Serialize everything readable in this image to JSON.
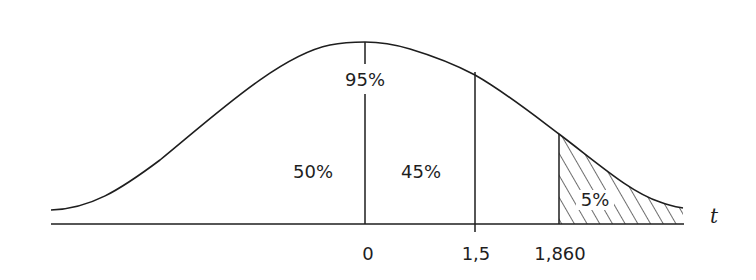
{
  "diagram": {
    "type": "t-distribution",
    "axis_variable": "t",
    "area_labels": {
      "left_half": "50%",
      "center_to_critical": "45%",
      "total_below_critical": "95%",
      "tail": "5%"
    },
    "tick_labels": {
      "mean": "0",
      "observed": "1,5",
      "critical": "1,860"
    },
    "colors": {
      "stroke": "#1e1e1e",
      "background": "#ffffff"
    }
  }
}
